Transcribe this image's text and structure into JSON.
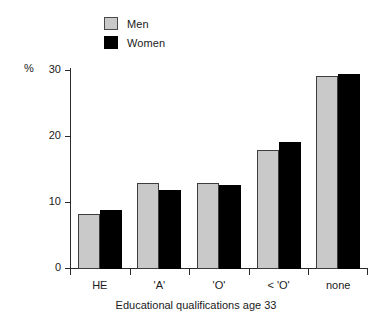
{
  "chart_data": {
    "type": "bar",
    "title": "",
    "subtitle": "",
    "xlabel": "Educational qualifications age 33",
    "ylabel": "%",
    "categories": [
      "HE",
      "'A'",
      "'O'",
      "< 'O'",
      "none"
    ],
    "series": [
      {
        "name": "Men",
        "color": "#c9c9c9",
        "values": [
          8.3,
          13.0,
          13.1,
          18.0,
          29.3
        ]
      },
      {
        "name": "Women",
        "color": "#000000",
        "values": [
          9.0,
          12.0,
          12.8,
          19.2,
          29.5
        ]
      }
    ],
    "ylim": [
      0,
      30
    ],
    "yticks": [
      "0",
      "10",
      "20",
      "30"
    ],
    "ytick_values": [
      0,
      10,
      20,
      30
    ],
    "grid": false,
    "legend_position": "top-left"
  },
  "legend": {
    "items": [
      {
        "label": "Men"
      },
      {
        "label": "Women"
      }
    ]
  },
  "axes": {
    "y_title": "%",
    "x_title": "Educational qualifications age 33"
  }
}
